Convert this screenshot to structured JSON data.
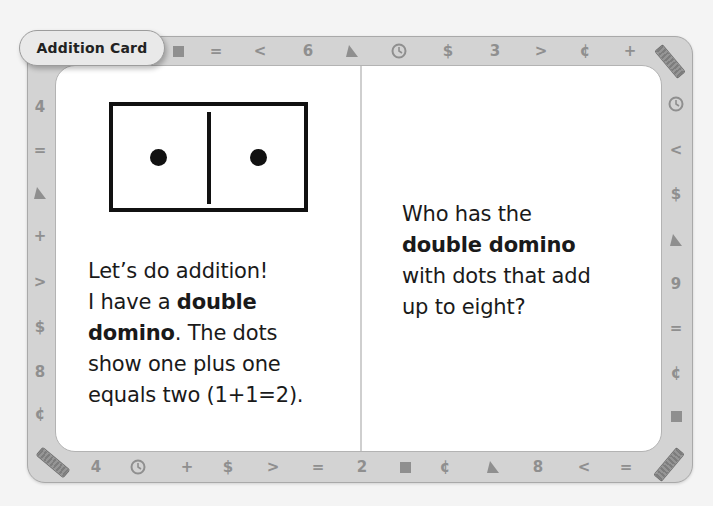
{
  "card": {
    "title": "Addition Card",
    "colors": {
      "border": "#d3d3d3",
      "border_outline": "#a9a9a9",
      "symbol": "#8f8f8f",
      "panel": "#ffffff",
      "text": "#1a1a1a"
    }
  },
  "border_symbols": {
    "top": [
      "square",
      "=",
      "<",
      "6",
      "triangle",
      "clock",
      "$",
      "3",
      ">",
      "¢",
      "+"
    ],
    "right": [
      "clock",
      "<",
      "$",
      "triangle",
      "9",
      "=",
      "¢",
      "square"
    ],
    "bottom": [
      "4",
      "clock",
      "+",
      "$",
      ">",
      "=",
      "2",
      "square",
      "¢",
      "triangle",
      "8",
      "<",
      "="
    ],
    "left": [
      "4",
      "=",
      "triangle",
      "+",
      ">",
      "$",
      "8",
      "¢"
    ],
    "corners": [
      "ruler",
      "ruler",
      "ruler"
    ]
  },
  "left_panel": {
    "domino": {
      "left_dots": 1,
      "right_dots": 1
    },
    "line1": "Let’s do addition!",
    "line2_pre": "I have a ",
    "line2_bold": "double",
    "line3_bold": "domino",
    "line3_post": ". The dots",
    "line4": "show one plus one",
    "line5": "equals two (1+1=2)."
  },
  "right_panel": {
    "line1": "Who has the",
    "line2_bold": "double domino",
    "line3": "with dots that add",
    "line4": "up to eight?"
  }
}
